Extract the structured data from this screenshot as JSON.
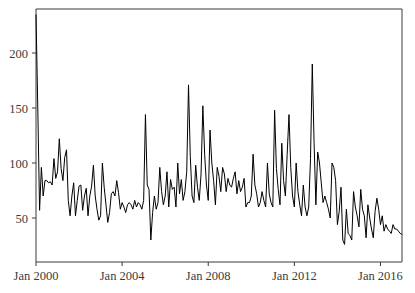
{
  "chart_data": {
    "type": "line",
    "title": "",
    "xlabel": "",
    "ylabel": "",
    "grid": false,
    "legend": null,
    "xlim": [
      "Jan 2000",
      "Jan 2016"
    ],
    "ylim": [
      10,
      240
    ],
    "yticks": [
      50,
      100,
      150,
      200
    ],
    "ytick_labels": [
      "50",
      "100",
      "150",
      "200"
    ],
    "xticks": [
      "Jan 2000",
      "Jan 2004",
      "Jan 2008",
      "Jan 2012",
      "Jan 2016"
    ],
    "xtick_labels": [
      "Jan 2000",
      "Jan 2004",
      "Jan 2008",
      "Jan 2012",
      "Jan 2016"
    ],
    "x_start": "2000-01",
    "x_step_months": 1,
    "n_points": 193,
    "series": [
      {
        "name": "series-1",
        "color": "#000000",
        "values": [
          235,
          150,
          57,
          96,
          70,
          84,
          84,
          82,
          83,
          80,
          104,
          86,
          92,
          122,
          95,
          84,
          105,
          112,
          66,
          52,
          70,
          82,
          52,
          66,
          79,
          80,
          57,
          70,
          77,
          52,
          70,
          79,
          98,
          70,
          58,
          48,
          52,
          100,
          78,
          62,
          46,
          55,
          72,
          74,
          70,
          84,
          73,
          58,
          64,
          60,
          55,
          62,
          64,
          62,
          58,
          66,
          60,
          64,
          62,
          58,
          66,
          144,
          80,
          76,
          30,
          55,
          70,
          58,
          64,
          96,
          74,
          62,
          70,
          92,
          60,
          85,
          76,
          78,
          60,
          100,
          72,
          85,
          66,
          74,
          92,
          171,
          106,
          70,
          64,
          98,
          78,
          66,
          90,
          152,
          108,
          80,
          66,
          130,
          100,
          84,
          62,
          96,
          88,
          74,
          96,
          90,
          74,
          86,
          80,
          78,
          86,
          92,
          72,
          84,
          74,
          78,
          86,
          60,
          64,
          64,
          70,
          108,
          80,
          72,
          60,
          64,
          74,
          66,
          60,
          100,
          72,
          64,
          60,
          148,
          95,
          76,
          62,
          118,
          84,
          70,
          108,
          144,
          96,
          70,
          60,
          100,
          74,
          62,
          52,
          80,
          60,
          52,
          60,
          104,
          190,
          118,
          62,
          110,
          100,
          82,
          64,
          70,
          64,
          58,
          50,
          100,
          96,
          84,
          44,
          56,
          78,
          30,
          26,
          58,
          36,
          34,
          30,
          74,
          60,
          52,
          42,
          76,
          58,
          52,
          32,
          62,
          50,
          40,
          32,
          56,
          68,
          58,
          44,
          52,
          38,
          44,
          40,
          38,
          36,
          44,
          40,
          40,
          38,
          36,
          35
        ]
      }
    ]
  },
  "figure": {
    "background": "#ffffff",
    "axis_color": "#3a3a3a",
    "line_color": "#000000"
  }
}
